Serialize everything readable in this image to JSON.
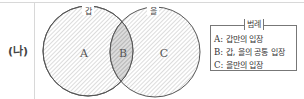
{
  "row_label": "(나)",
  "venn": {
    "left_set": {
      "title": "갑",
      "region_label": "A"
    },
    "intersection": {
      "region_label": "B"
    },
    "right_set": {
      "title": "을",
      "region_label": "C"
    }
  },
  "legend": {
    "title": "범례",
    "items": [
      {
        "key": "A:",
        "desc": " 갑만의 입장"
      },
      {
        "key": "B:",
        "desc": " 갑, 을의 공통 입장"
      },
      {
        "key": "C:",
        "desc": " 을만의 입장"
      }
    ]
  },
  "colors": {
    "circle_stroke": "#555555",
    "hatch": "#9a9a9a",
    "intersection_fill": "#c8c8c8"
  }
}
